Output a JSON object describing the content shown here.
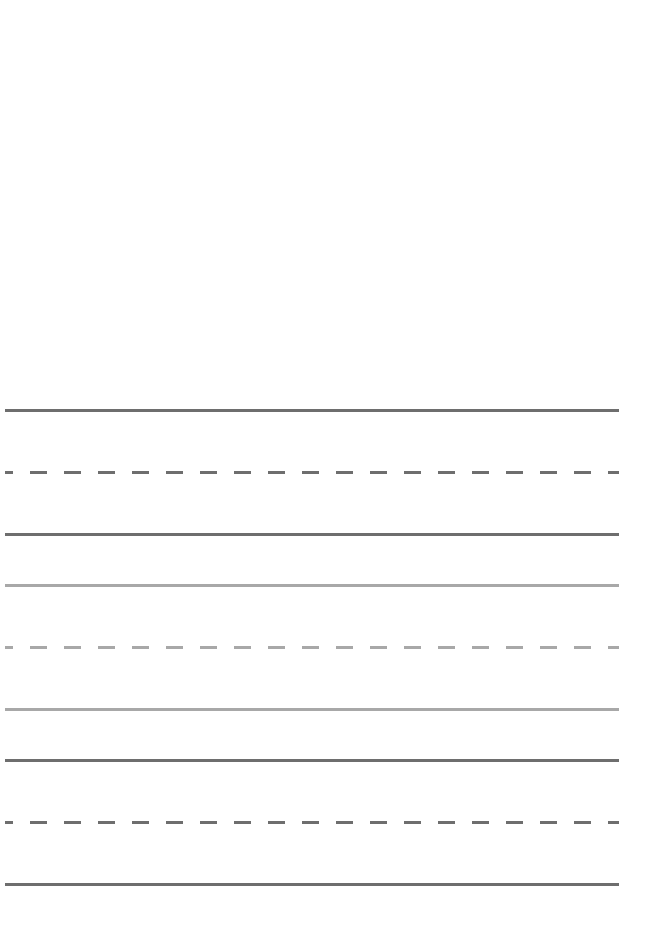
{
  "page": {
    "type": "handwriting-practice-sheet",
    "background": "#ffffff"
  },
  "line_groups": [
    {
      "name": "group-1",
      "color": "#6e6e6e",
      "top_y": 409,
      "mid_y": 471,
      "bottom_y": 533
    },
    {
      "name": "group-2",
      "color": "#a8a8a8",
      "top_y": 584,
      "mid_y": 646,
      "bottom_y": 708
    },
    {
      "name": "group-3",
      "color": "#6e6e6e",
      "top_y": 759,
      "mid_y": 821,
      "bottom_y": 883
    }
  ],
  "dash_pattern": {
    "offset": -9,
    "dash_length": 17,
    "period": 34
  }
}
